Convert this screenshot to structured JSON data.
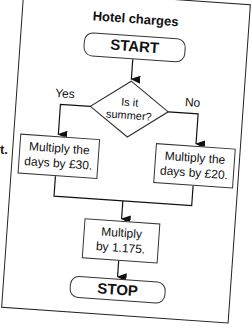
{
  "stray_text": "t.",
  "flowchart": {
    "title": "Hotel charges",
    "start": "START",
    "decision": {
      "line1": "Is it",
      "line2": "summer?"
    },
    "yes_label": "Yes",
    "no_label": "No",
    "yes_process": {
      "line1": "Multiply the",
      "line2": "days by £30."
    },
    "no_process": {
      "line1": "Multiply the",
      "line2": "days by £20."
    },
    "final_process": {
      "line1": "Multiply",
      "line2": "by 1.175."
    },
    "stop": "STOP"
  }
}
